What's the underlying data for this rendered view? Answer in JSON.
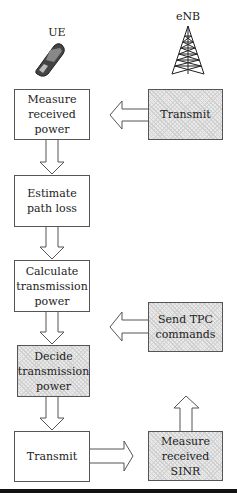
{
  "labels": {
    "ue": "UE",
    "enb": "eNB"
  },
  "ue_column": [
    {
      "id": "measure-received-power",
      "text": "Measure received power",
      "hatched": false
    },
    {
      "id": "estimate-path-loss",
      "text": "Estimate path loss",
      "hatched": false
    },
    {
      "id": "calculate-transmission-power",
      "text": "Calculate transmission power",
      "hatched": false
    },
    {
      "id": "decide-transmission-power",
      "text": "Decide transmission power",
      "hatched": true
    },
    {
      "id": "transmit-ue",
      "text": "Transmit",
      "hatched": false
    }
  ],
  "enb_column": [
    {
      "id": "transmit-enb",
      "text": "Transmit",
      "hatched": true
    },
    {
      "id": "send-tpc-commands",
      "text": "Send TPC commands",
      "hatched": true
    },
    {
      "id": "measure-received-sinr",
      "text": "Measure received SINR",
      "hatched": true
    }
  ],
  "icons": {
    "ue": "mobile-phone-icon",
    "enb": "cell-tower-icon"
  }
}
